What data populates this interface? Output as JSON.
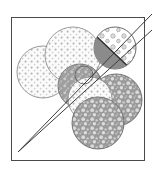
{
  "figure": {
    "title": "",
    "caption": "",
    "background_color": "#ffffff",
    "frame": {
      "name": "rectangular-border",
      "x": 11,
      "y": 17,
      "width": 133,
      "height": 143,
      "stroke_color": "#4a4a4a",
      "stroke_width": 1,
      "fill": "none"
    },
    "diagonals": [
      {
        "name": "diagonal-line-upper",
        "x1": 18,
        "y1": 152,
        "x2": 152,
        "y2": 14,
        "stroke_color": "#3c3c3c",
        "stroke_width": 1
      },
      {
        "name": "diagonal-line-lower",
        "x1": 18,
        "y1": 152,
        "x2": 152,
        "y2": 30,
        "stroke_color": "#3c3c3c",
        "stroke_width": 1
      }
    ],
    "circles": [
      {
        "name": "circle-light-dotted-upper-left",
        "cx": 43,
        "cy": 72,
        "r": 26,
        "fill_pattern": "fine-dot-grid-light",
        "fill_color": "#fbfbfb",
        "dot_color": "#b9b9b9",
        "stroke_color": "#8f8f8f"
      },
      {
        "name": "circle-light-dotted-top",
        "cx": 73,
        "cy": 55,
        "r": 28,
        "fill_pattern": "fine-dot-grid-light",
        "fill_color": "#fafafa",
        "dot_color": "#b5b5b5",
        "stroke_color": "#8f8f8f"
      },
      {
        "name": "circle-gray-dotted-middle",
        "cx": 80,
        "cy": 86,
        "r": 22,
        "fill_pattern": "speckle-mid",
        "fill_color": "#9e9e9e",
        "dot_color": "#cfcfcf",
        "stroke_color": "#6e6e6e"
      },
      {
        "name": "circle-light-dotted-center",
        "cx": 90,
        "cy": 99,
        "r": 22,
        "fill_pattern": "fine-dot-grid-light",
        "fill_color": "#f7f7f7",
        "dot_color": "#bcbcbc",
        "stroke_color": "#8f8f8f"
      },
      {
        "name": "circle-bubble-right",
        "cx": 116,
        "cy": 100,
        "r": 26,
        "fill_pattern": "dense-bubble",
        "fill_color": "#9a9a9a",
        "dot_color": "#d8d8d8",
        "stroke_color": "#6a6a6a"
      },
      {
        "name": "circle-bubble-bottom",
        "cx": 98,
        "cy": 123,
        "r": 26,
        "fill_pattern": "dense-bubble",
        "fill_color": "#9a9a9a",
        "dot_color": "#d8d8d8",
        "stroke_color": "#6a6a6a"
      },
      {
        "name": "circle-bubble-upper-right",
        "cx": 115,
        "cy": 48,
        "r": 21,
        "fill_pattern": "sparse-floral",
        "fill_color": "#ffffff",
        "dot_color": "#9c9c9c",
        "stroke_color": "#5e5e5e"
      },
      {
        "name": "circle-small-outline-center",
        "cx": 84,
        "cy": 75,
        "r": 9,
        "fill_pattern": "none",
        "fill_color": "none",
        "dot_color": "#9c9c9c",
        "stroke_color": "#6a6a6a"
      }
    ],
    "wedge": {
      "name": "dark-wedge-shape",
      "fill_color": "#8b8b8b",
      "stroke_color": "#2e2e2e",
      "description": "dark gray wedge in upper-right circle bounded by the upper diagonal"
    }
  }
}
